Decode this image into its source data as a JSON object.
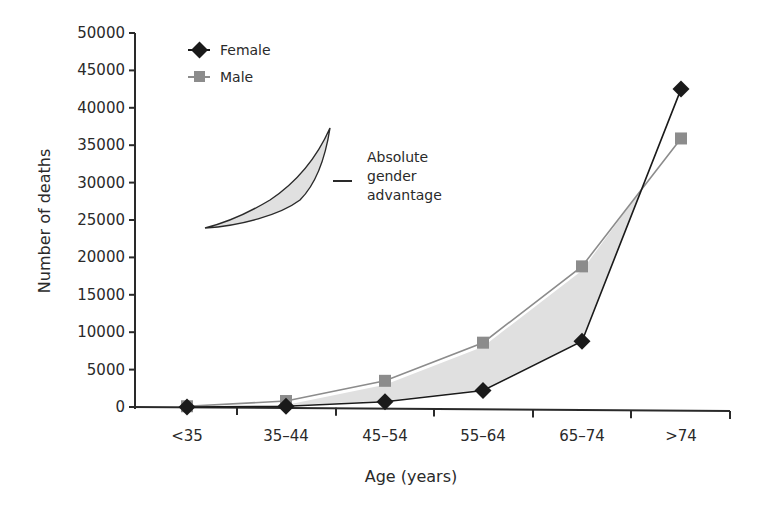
{
  "chart_data": {
    "type": "line",
    "title": "",
    "xlabel": "Age (years)",
    "ylabel": "Number of deaths",
    "categories": [
      "<35",
      "35–44",
      "45–54",
      "55–64",
      "65–74",
      ">74"
    ],
    "series": [
      {
        "name": "Female",
        "marker": "diamond",
        "color": "#1a1a1a",
        "values": [
          0,
          100,
          700,
          2200,
          8800,
          42500
        ]
      },
      {
        "name": "Male",
        "marker": "square",
        "color": "#8c8c8c",
        "values": [
          100,
          800,
          3500,
          8600,
          18800,
          35900
        ]
      }
    ],
    "ylim": [
      0,
      50000
    ],
    "yticks": [
      0,
      5000,
      10000,
      15000,
      20000,
      25000,
      30000,
      35000,
      40000,
      45000,
      50000
    ],
    "ytick_labels": [
      "0",
      "5000",
      "10000",
      "15000",
      "20000",
      "25000",
      "30000",
      "35000",
      "40000",
      "45000",
      "50000"
    ],
    "grid": false,
    "legend_position": "upper-left",
    "shaded_region": {
      "between": [
        "Male",
        "Female"
      ],
      "color": "#e0e0e0",
      "label": "Absolute gender advantage"
    },
    "annotation": {
      "lines": [
        "Absolute",
        "gender",
        "advantage"
      ]
    }
  },
  "legend": {
    "female_label": "Female",
    "male_label": "Male"
  },
  "annotation": {
    "line1": "Absolute",
    "line2": "gender",
    "line3": "advantage"
  },
  "axes": {
    "xlabel": "Age (years)",
    "ylabel": "Number of deaths"
  },
  "colors": {
    "female": "#1a1a1a",
    "male": "#8c8c8c",
    "band": "#e0e0e0",
    "axis": "#2a2a2a"
  }
}
